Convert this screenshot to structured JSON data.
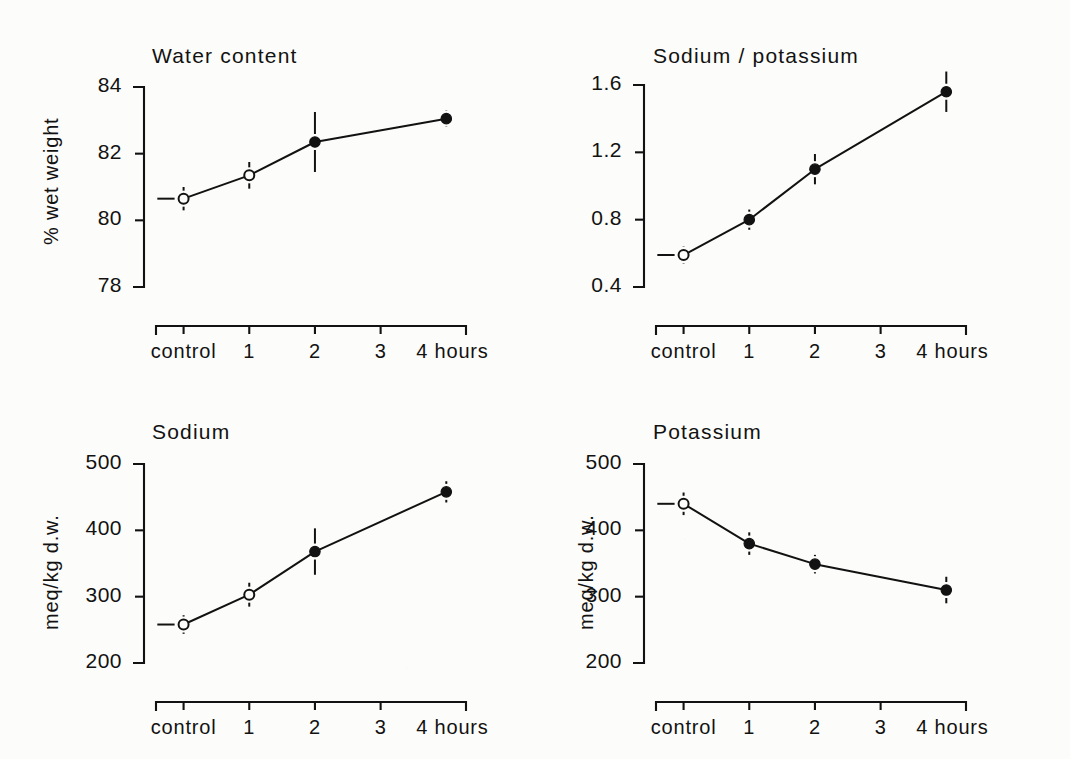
{
  "figure": {
    "background_color": "#fcfcfa",
    "ink_color": "#121212",
    "x_categories": [
      "control",
      "1",
      "2",
      "3",
      "4 hours"
    ]
  },
  "chart_data": [
    {
      "type": "line",
      "panel": "top-left",
      "title": "Water content",
      "xlabel": "",
      "ylabel": "% wet weight",
      "x": [
        "control",
        "1",
        "2",
        "4"
      ],
      "x_positions": [
        0,
        1,
        2,
        4
      ],
      "values": [
        80.65,
        81.35,
        82.35,
        83.05
      ],
      "errors": [
        0.35,
        0.4,
        0.9,
        0.25
      ],
      "marker_filled": [
        false,
        false,
        true,
        true
      ],
      "yticks": [
        78,
        80,
        82,
        84
      ],
      "ytick_labels": [
        "78",
        "80",
        "82",
        "84"
      ],
      "ylim": [
        78,
        84
      ],
      "xlim": [
        -0.42,
        4.3
      ],
      "grid": false,
      "legend": "none"
    },
    {
      "type": "line",
      "panel": "top-right",
      "title": "Sodium / potassium",
      "xlabel": "",
      "ylabel": "",
      "x": [
        "control",
        "1",
        "2",
        "4"
      ],
      "x_positions": [
        0,
        1,
        2,
        4
      ],
      "values": [
        0.59,
        0.8,
        1.1,
        1.56
      ],
      "errors": [
        0.05,
        0.06,
        0.09,
        0.12
      ],
      "marker_filled": [
        false,
        true,
        true,
        true
      ],
      "yticks": [
        0.4,
        0.8,
        1.2,
        1.6
      ],
      "ytick_labels": [
        "0.4",
        "0.8",
        "1.2",
        "1.6"
      ],
      "ylim": [
        0.4,
        1.6
      ],
      "xlim": [
        -0.42,
        4.3
      ],
      "grid": false,
      "legend": "none"
    },
    {
      "type": "line",
      "panel": "bottom-left",
      "title": "Sodium",
      "xlabel": "",
      "ylabel": "meq/kg d.w.",
      "x": [
        "control",
        "1",
        "2",
        "4"
      ],
      "x_positions": [
        0,
        1,
        2,
        4
      ],
      "values": [
        258,
        303,
        368,
        458
      ],
      "errors": [
        14,
        18,
        35,
        16
      ],
      "marker_filled": [
        false,
        false,
        true,
        true
      ],
      "yticks": [
        200,
        300,
        400,
        500
      ],
      "ytick_labels": [
        "200",
        "300",
        "400",
        "500"
      ],
      "ylim": [
        200,
        500
      ],
      "xlim": [
        -0.42,
        4.3
      ],
      "grid": false,
      "legend": "none"
    },
    {
      "type": "line",
      "panel": "bottom-right",
      "title": "Potassium",
      "xlabel": "",
      "ylabel": "meq/kg d.w.",
      "x": [
        "control",
        "1",
        "2",
        "4"
      ],
      "x_positions": [
        0,
        1,
        2,
        4
      ],
      "values": [
        440,
        380,
        349,
        310
      ],
      "errors": [
        17,
        17,
        14,
        20
      ],
      "marker_filled": [
        false,
        true,
        true,
        true
      ],
      "yticks": [
        200,
        300,
        400,
        500
      ],
      "ytick_labels": [
        "200",
        "300",
        "400",
        "500"
      ],
      "ylim": [
        200,
        500
      ],
      "xlim": [
        -0.42,
        4.3
      ],
      "grid": false,
      "legend": "none"
    }
  ]
}
